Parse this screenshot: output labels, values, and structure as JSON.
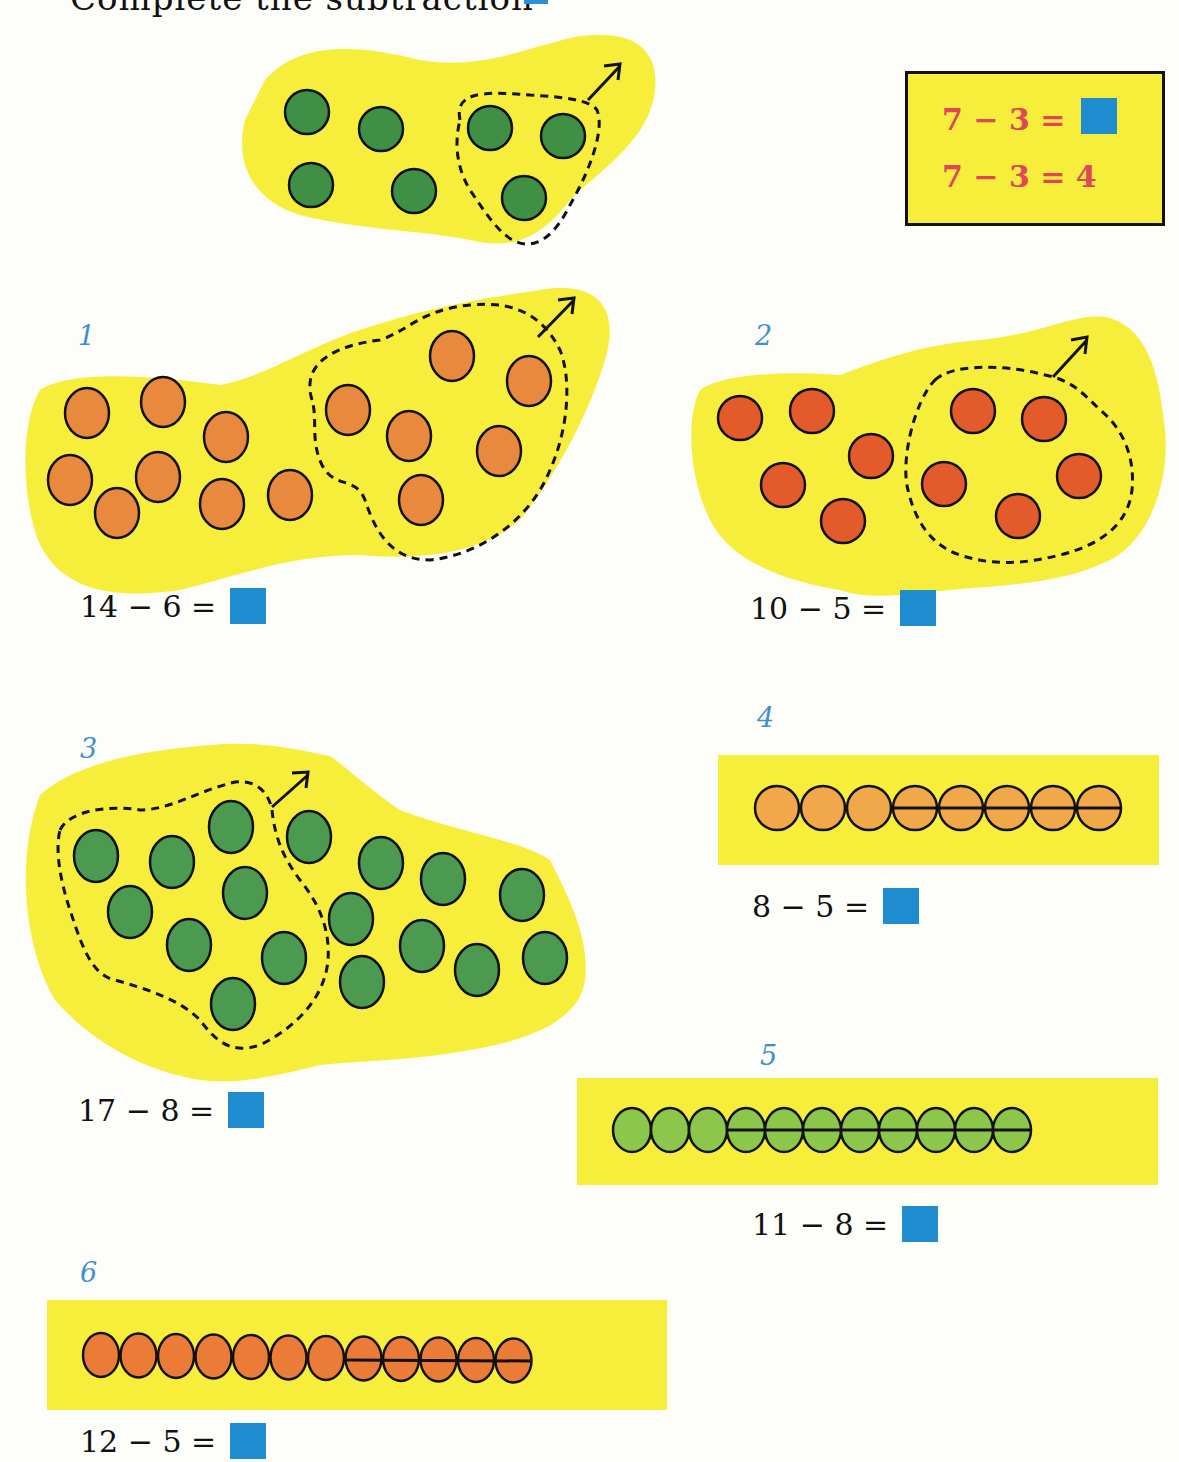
{
  "header": {
    "text_cropped": "Complete the subtraction",
    "answer_box_color": "#2a8fd6"
  },
  "example": {
    "line1": "7 − 3 =",
    "line2": "7 − 3 = 4",
    "text_color": "#e0455a",
    "background": "#f7ee3c",
    "answer_box_color": "#1f8cd0",
    "illustration": {
      "total": 7,
      "taken_away": 3,
      "counter_color": "#3f8f45"
    }
  },
  "problems": [
    {
      "number": "1",
      "equation": "14 − 6 =",
      "total": 14,
      "taken_away": 6,
      "layout": "blob",
      "counter_color": "#e8893e"
    },
    {
      "number": "2",
      "equation": "10 − 5 =",
      "total": 10,
      "taken_away": 5,
      "layout": "blob",
      "counter_color": "#e35a2b"
    },
    {
      "number": "3",
      "equation": "17 − 8 =",
      "total": 17,
      "taken_away": 8,
      "layout": "blob",
      "counter_color": "#4b9a4f"
    },
    {
      "number": "4",
      "equation": "8 − 5 =",
      "total": 8,
      "taken_away": 5,
      "layout": "row",
      "counter_color": "#f0a84a"
    },
    {
      "number": "5",
      "equation": "11 − 8 =",
      "total": 11,
      "taken_away": 8,
      "layout": "row",
      "counter_color": "#8cc64a"
    },
    {
      "number": "6",
      "equation": "12 − 5 =",
      "total": 12,
      "taken_away": 5,
      "layout": "row",
      "counter_color": "#ea7c37"
    }
  ],
  "colors": {
    "highlight_yellow": "#f7ee3c",
    "number_blue": "#3d8fd0",
    "answer_box_blue": "#1f8cd0",
    "outline": "#111111"
  }
}
